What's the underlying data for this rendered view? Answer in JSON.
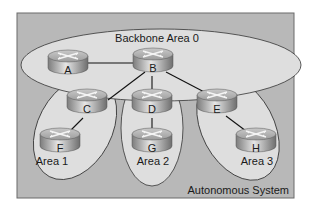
{
  "diagram": {
    "type": "ospf-area-topology",
    "autonomous_system_label": "Autonomous System",
    "areas": [
      {
        "id": "area0",
        "label": "Backbone Area 0"
      },
      {
        "id": "area1",
        "label": "Area 1"
      },
      {
        "id": "area2",
        "label": "Area 2"
      },
      {
        "id": "area3",
        "label": "Area 3"
      }
    ],
    "routers": [
      {
        "id": "A",
        "label": "A"
      },
      {
        "id": "B",
        "label": "B"
      },
      {
        "id": "C",
        "label": "C"
      },
      {
        "id": "D",
        "label": "D"
      },
      {
        "id": "E",
        "label": "E"
      },
      {
        "id": "F",
        "label": "F"
      },
      {
        "id": "G",
        "label": "G"
      },
      {
        "id": "H",
        "label": "H"
      }
    ],
    "links": [
      {
        "from": "A",
        "to": "B"
      },
      {
        "from": "B",
        "to": "C"
      },
      {
        "from": "B",
        "to": "D"
      },
      {
        "from": "B",
        "to": "E"
      },
      {
        "from": "C",
        "to": "F"
      },
      {
        "from": "D",
        "to": "G"
      },
      {
        "from": "E",
        "to": "H"
      }
    ],
    "colors": {
      "as_background": "#b8b8b8",
      "area_fill": "#dcdcdc",
      "outline": "#333333",
      "router_body": "#9a9a9a"
    }
  }
}
